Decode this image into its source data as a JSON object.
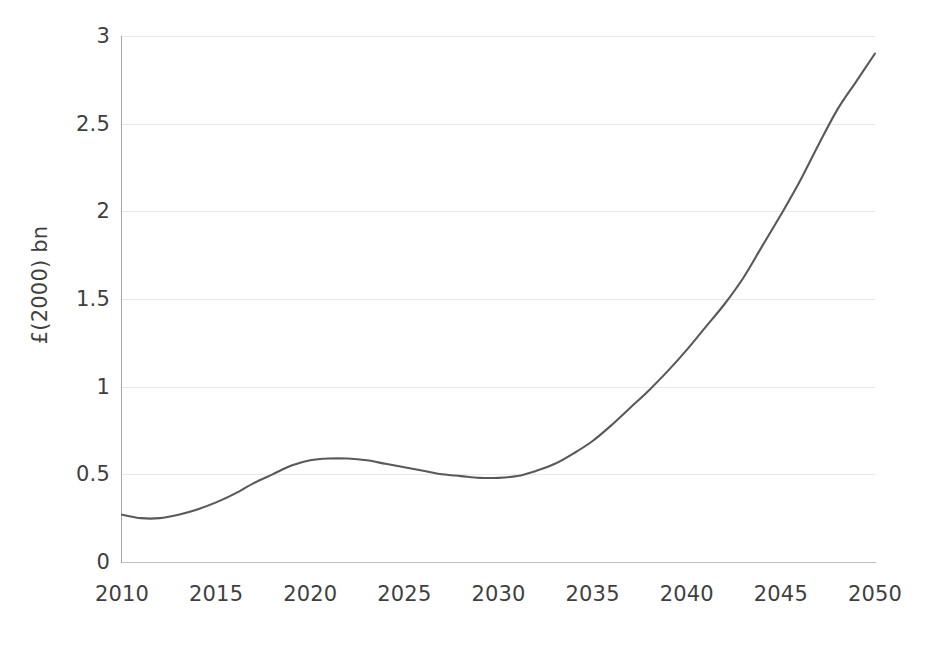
{
  "chart_data": {
    "type": "line",
    "title": "",
    "xlabel": "",
    "ylabel": "£(2000) bn",
    "xlim": [
      2010,
      2050
    ],
    "ylim": [
      0,
      3
    ],
    "grid": "horizontal-faint",
    "legend": "none",
    "line_color": "#595959",
    "x_ticks": [
      "2010",
      "2015",
      "2020",
      "2025",
      "2030",
      "2035",
      "2040",
      "2045",
      "2050"
    ],
    "y_ticks": [
      "0",
      "0.5",
      "1",
      "1.5",
      "2",
      "2.5",
      "3"
    ],
    "x_tick_values": [
      2010,
      2015,
      2020,
      2025,
      2030,
      2035,
      2040,
      2045,
      2050
    ],
    "y_tick_values": [
      0,
      0.5,
      1,
      1.5,
      2,
      2.5,
      3
    ],
    "series": [
      {
        "name": "cost",
        "x": [
          2010,
          2011,
          2012,
          2013,
          2014,
          2015,
          2016,
          2017,
          2018,
          2019,
          2020,
          2021,
          2022,
          2023,
          2024,
          2025,
          2026,
          2027,
          2028,
          2029,
          2030,
          2031,
          2032,
          2033,
          2034,
          2035,
          2036,
          2037,
          2038,
          2039,
          2040,
          2041,
          2042,
          2043,
          2044,
          2045,
          2046,
          2047,
          2048,
          2049,
          2050
        ],
        "values": [
          0.27,
          0.25,
          0.25,
          0.27,
          0.3,
          0.34,
          0.39,
          0.45,
          0.5,
          0.55,
          0.58,
          0.59,
          0.59,
          0.58,
          0.56,
          0.54,
          0.52,
          0.5,
          0.49,
          0.48,
          0.48,
          0.49,
          0.52,
          0.56,
          0.62,
          0.69,
          0.78,
          0.88,
          0.98,
          1.09,
          1.21,
          1.34,
          1.47,
          1.62,
          1.8,
          1.98,
          2.17,
          2.38,
          2.58,
          2.74,
          2.9
        ]
      }
    ],
    "annotations": {
      "local_min_early": {
        "x": 2011.5,
        "y": 0.245
      },
      "local_max": {
        "x": 2021,
        "y": 0.59
      },
      "local_min_late": {
        "x": 2029,
        "y": 0.48
      },
      "end_point": {
        "x": 2050,
        "y": 2.9
      }
    }
  }
}
